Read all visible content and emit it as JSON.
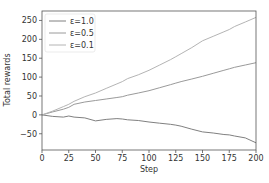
{
  "chart_data": {
    "type": "line",
    "title": "",
    "xlabel": "Step",
    "ylabel": "Total rewards",
    "xlim": [
      0,
      200
    ],
    "ylim": [
      -93,
      275
    ],
    "xticks": [
      0,
      25,
      50,
      75,
      100,
      125,
      150,
      175,
      200
    ],
    "yticks": [
      -50,
      0,
      50,
      100,
      150,
      200,
      250
    ],
    "grid": false,
    "legend_position": "upper left",
    "x": [
      0,
      10,
      20,
      25,
      30,
      40,
      50,
      60,
      70,
      75,
      80,
      90,
      100,
      110,
      120,
      125,
      130,
      140,
      150,
      160,
      170,
      175,
      180,
      190,
      200
    ],
    "series": [
      {
        "name": "ε=1.0",
        "color": "#808080",
        "values": [
          0,
          -4,
          -6,
          -3,
          -6,
          -8,
          -16,
          -12,
          -10,
          -11,
          -13,
          -15,
          -19,
          -22,
          -25,
          -27,
          -30,
          -38,
          -45,
          -48,
          -52,
          -53,
          -56,
          -61,
          -74
        ]
      },
      {
        "name": "ε=0.5",
        "color": "#9a9a9a",
        "values": [
          0,
          8,
          15,
          20,
          28,
          34,
          38,
          42,
          46,
          48,
          52,
          58,
          64,
          72,
          80,
          84,
          88,
          95,
          102,
          110,
          118,
          122,
          126,
          132,
          138
        ]
      },
      {
        "name": "ε=0.1",
        "color": "#b4b4b4",
        "values": [
          0,
          10,
          22,
          28,
          36,
          48,
          58,
          70,
          82,
          88,
          96,
          106,
          118,
          132,
          146,
          154,
          162,
          178,
          196,
          208,
          220,
          226,
          234,
          246,
          258
        ]
      }
    ]
  }
}
